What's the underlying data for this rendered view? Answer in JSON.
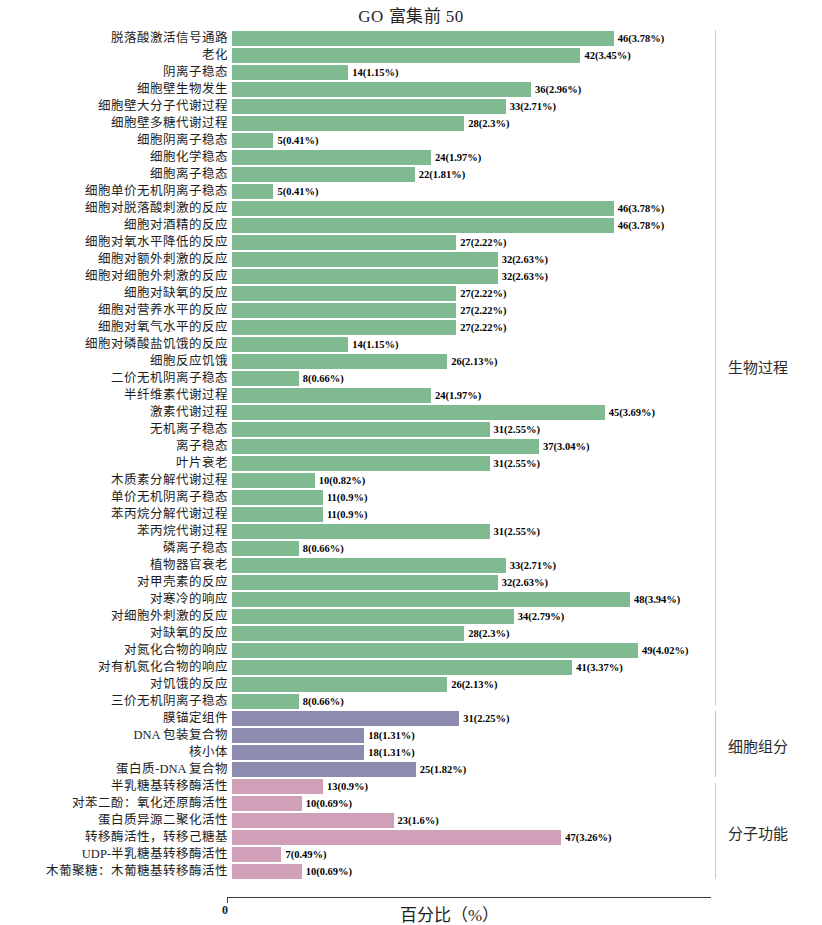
{
  "chart_title": "GO 富集前 50",
  "axis": {
    "x_title": "百分比（%）",
    "zero_tick": "0",
    "x_min_percent": 0,
    "x_max_percent": 4.75
  },
  "ontologies": [
    {
      "key": "bp",
      "label": "生物过程",
      "color": "#7fba91"
    },
    {
      "key": "cc",
      "label": "细胞组分",
      "color": "#8d8cb0"
    },
    {
      "key": "mf",
      "label": "分子功能",
      "color": "#cfa0b8"
    }
  ],
  "chart_data": {
    "type": "bar",
    "orientation": "horizontal",
    "title": "GO 富集前 50",
    "xlabel": "百分比（%）",
    "ylabel": "",
    "xlim": [
      0,
      4.75
    ],
    "grid": false,
    "legend_position": "right-brackets",
    "value_label_format": "count(percent%)",
    "categories": [
      "脱落酸激活信号通路",
      "老化",
      "阴离子稳态",
      "细胞壁生物发生",
      "细胞壁大分子代谢过程",
      "细胞壁多糖代谢过程",
      "细胞阴离子稳态",
      "细胞化学稳态",
      "细胞离子稳态",
      "细胞单价无机阴离子稳态",
      "细胞对脱落酸刺激的反应",
      "细胞对酒精的反应",
      "细胞对氧水平降低的反应",
      "细胞对额外刺激的反应",
      "细胞对细胞外刺激的反应",
      "细胞对缺氧的反应",
      "细胞对营养水平的反应",
      "细胞对氧气水平的反应",
      "细胞对磷酸盐饥饿的反应",
      "细胞反应饥饿",
      "二价无机阴离子稳态",
      "半纤维素代谢过程",
      "激素代谢过程",
      "无机离子稳态",
      "离子稳态",
      "叶片衰老",
      "木质素分解代谢过程",
      "单价无机阴离子稳态",
      "苯丙烷分解代谢过程",
      "苯丙烷代谢过程",
      "磷离子稳态",
      "植物器官衰老",
      "对甲壳素的反应",
      "对寒冷的响应",
      "对细胞外刺激的反应",
      "对缺氧的反应",
      "对氮化合物的响应",
      "对有机氮化合物的响应",
      "对饥饿的反应",
      "三价无机阴离子稳态",
      "膜锚定组件",
      "DNA 包装复合物",
      "核小体",
      "蛋白质-DNA 复合物",
      "半乳糖基转移酶活性",
      "对苯二酚：氧化还原酶活性",
      "蛋白质异源二聚化活性",
      "转移酶活性，转移己糖基",
      "UDP-半乳糖基转移酶活性",
      "木葡聚糖：木葡糖基转移酶活性"
    ],
    "counts": [
      46,
      42,
      14,
      36,
      33,
      28,
      5,
      24,
      22,
      5,
      46,
      46,
      27,
      32,
      32,
      27,
      27,
      27,
      14,
      26,
      8,
      24,
      45,
      31,
      37,
      31,
      10,
      11,
      11,
      31,
      8,
      33,
      32,
      48,
      34,
      28,
      49,
      41,
      26,
      8,
      31,
      18,
      18,
      25,
      13,
      10,
      23,
      47,
      7,
      10
    ],
    "values": [
      3.78,
      3.45,
      1.15,
      2.96,
      2.71,
      2.3,
      0.41,
      1.97,
      1.81,
      0.41,
      3.78,
      3.78,
      2.22,
      2.63,
      2.63,
      2.22,
      2.22,
      2.22,
      1.15,
      2.13,
      0.66,
      1.97,
      3.69,
      2.55,
      3.04,
      2.55,
      0.82,
      0.9,
      0.9,
      2.55,
      0.66,
      2.71,
      2.63,
      3.94,
      2.79,
      2.3,
      4.02,
      3.37,
      2.13,
      0.66,
      2.25,
      1.31,
      1.31,
      1.82,
      0.9,
      0.69,
      1.6,
      3.26,
      0.49,
      0.69
    ],
    "data_labels": [
      "46(3.78%)",
      "42(3.45%)",
      "14(1.15%)",
      "36(2.96%)",
      "33(2.71%)",
      "28(2.3%)",
      "5(0.41%)",
      "24(1.97%)",
      "22(1.81%)",
      "5(0.41%)",
      "46(3.78%)",
      "46(3.78%)",
      "27(2.22%)",
      "32(2.63%)",
      "32(2.63%)",
      "27(2.22%)",
      "27(2.22%)",
      "27(2.22%)",
      "14(1.15%)",
      "26(2.13%)",
      "8(0.66%)",
      "24(1.97%)",
      "45(3.69%)",
      "31(2.55%)",
      "37(3.04%)",
      "31(2.55%)",
      "10(0.82%)",
      "11(0.9%)",
      "11(0.9%)",
      "31(2.55%)",
      "8(0.66%)",
      "33(2.71%)",
      "32(2.63%)",
      "48(3.94%)",
      "34(2.79%)",
      "28(2.3%)",
      "49(4.02%)",
      "41(3.37%)",
      "26(2.13%)",
      "8(0.66%)",
      "31(2.25%)",
      "18(1.31%)",
      "18(1.31%)",
      "25(1.82%)",
      "13(0.9%)",
      "10(0.69%)",
      "23(1.6%)",
      "47(3.26%)",
      "7(0.49%)",
      "10(0.69%)"
    ],
    "ontology_of_bar": [
      "bp",
      "bp",
      "bp",
      "bp",
      "bp",
      "bp",
      "bp",
      "bp",
      "bp",
      "bp",
      "bp",
      "bp",
      "bp",
      "bp",
      "bp",
      "bp",
      "bp",
      "bp",
      "bp",
      "bp",
      "bp",
      "bp",
      "bp",
      "bp",
      "bp",
      "bp",
      "bp",
      "bp",
      "bp",
      "bp",
      "bp",
      "bp",
      "bp",
      "bp",
      "bp",
      "bp",
      "bp",
      "bp",
      "bp",
      "bp",
      "cc",
      "cc",
      "cc",
      "cc",
      "mf",
      "mf",
      "mf",
      "mf",
      "mf",
      "mf"
    ],
    "series": [
      {
        "name": "生物过程",
        "color": "#7fba91",
        "start_index": 0,
        "end_index": 39
      },
      {
        "name": "细胞组分",
        "color": "#8d8cb0",
        "start_index": 40,
        "end_index": 43
      },
      {
        "name": "分子功能",
        "color": "#cfa0b8",
        "start_index": 44,
        "end_index": 49
      }
    ]
  }
}
